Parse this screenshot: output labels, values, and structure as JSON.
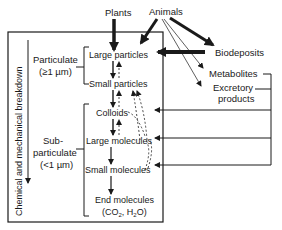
{
  "diagram": {
    "sources": {
      "plants": "Plants",
      "animals": "Animals"
    },
    "outputs": {
      "biodeposits": "Biodeposits",
      "metabolites": "Metabolites",
      "excretory_line1": "Excretory",
      "excretory_line2": "products"
    },
    "axis_label": "Chemical and mechanical breakdown",
    "groups": {
      "particulate": {
        "line1": "Particulate",
        "line2": "(≥1 µm)"
      },
      "subparticulate": {
        "line1": "Sub-",
        "line2": "particulate",
        "line3": "(<1 µm)"
      }
    },
    "stages": {
      "large_particles": "Large particles",
      "small_particles": "Small particles",
      "colloids": "Colloids",
      "large_molecules": "Large molecules",
      "small_molecules": "Small molecules",
      "end_molecules": "End molecules",
      "end_formula_open": "(CO",
      "end_formula_sub1": "2",
      "end_formula_mid": ", H",
      "end_formula_sub2": "2",
      "end_formula_close": "O)"
    },
    "colors": {
      "ink": "#1a1a1a",
      "background": "#ffffff"
    }
  }
}
